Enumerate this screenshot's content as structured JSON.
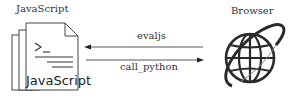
{
  "diagram": {
    "left_node": {
      "title": "JavaScript",
      "icon": "document-stack-icon",
      "icon_text": "JavaScript",
      "prompt_glyph": ">_"
    },
    "right_node": {
      "title": "Browser",
      "icon": "globe-icon"
    },
    "edges": [
      {
        "label": "evaljs",
        "from": "Browser",
        "to": "JavaScript"
      },
      {
        "label": "call_python",
        "from": "JavaScript",
        "to": "Browser"
      }
    ]
  }
}
